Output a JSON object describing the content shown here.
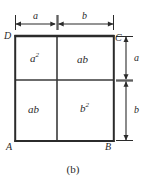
{
  "figure": {
    "caption": "(b)",
    "type": "geometric-diagram"
  },
  "corners": {
    "top_left": "D",
    "top_right": "C",
    "bottom_left": "A",
    "bottom_right": "B"
  },
  "cells": [
    {
      "id": "top-left",
      "label": "a",
      "exponent": "2"
    },
    {
      "id": "top-right",
      "label": "ab",
      "exponent": ""
    },
    {
      "id": "bottom-left",
      "label": "ab",
      "exponent": ""
    },
    {
      "id": "bottom-right",
      "label": "b",
      "exponent": "2"
    }
  ],
  "dimensions": {
    "top": [
      {
        "id": "top-a",
        "label": "a"
      },
      {
        "id": "top-b",
        "label": "b"
      }
    ],
    "right": [
      {
        "id": "right-a",
        "label": "a"
      },
      {
        "id": "right-b",
        "label": "b"
      }
    ]
  },
  "colors": {
    "stroke": "#2b2b2b",
    "inner_stroke": "#3a3a3a",
    "text": "#2a2a2a",
    "background": "#ffffff"
  }
}
